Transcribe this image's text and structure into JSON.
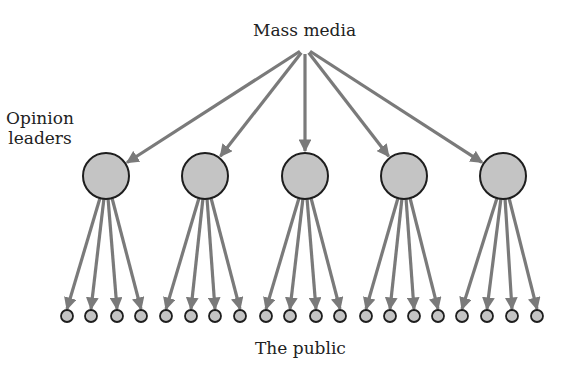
{
  "diagram": {
    "labels": {
      "source": "Mass media",
      "middle": "Opinion leaders",
      "middle_line1": "Opinion",
      "middle_line2": "leaders",
      "target": "The public"
    },
    "colors": {
      "arrow": "#7a7a7a",
      "node_fill": "#c4c4c4",
      "node_stroke": "#1e1e1e",
      "text": "#222222"
    },
    "source_point": {
      "x": 305,
      "y": 48
    },
    "opinion_leaders": [
      {
        "id": "leader-1",
        "x": 106,
        "y": 176,
        "r": 23
      },
      {
        "id": "leader-2",
        "x": 205,
        "y": 176,
        "r": 23
      },
      {
        "id": "leader-3",
        "x": 305,
        "y": 176,
        "r": 23
      },
      {
        "id": "leader-4",
        "x": 404,
        "y": 176,
        "r": 23
      },
      {
        "id": "leader-5",
        "x": 503,
        "y": 176,
        "r": 23
      }
    ],
    "public_nodes": [
      [
        67,
        91,
        117,
        141
      ],
      [
        166,
        191,
        215,
        240
      ],
      [
        266,
        290,
        316,
        340
      ],
      [
        366,
        390,
        414,
        438
      ],
      [
        462,
        487,
        512,
        537
      ]
    ],
    "public_y": 316,
    "public_r": 6
  }
}
